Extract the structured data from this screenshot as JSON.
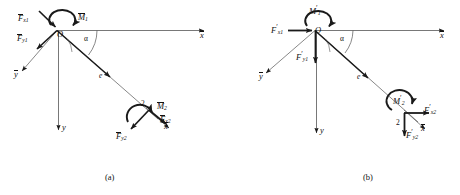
{
  "figure": {
    "type": "mechanics-free-body-diagram",
    "stroke_color": "#1a1a1a",
    "text_color": "#111111",
    "background": "#ffffff"
  },
  "panels": [
    {
      "id": "a",
      "caption": "(a)",
      "origin_label": "O",
      "angle_label": "α",
      "eccentricity_label": "e",
      "point_label": "2",
      "axes": [
        {
          "name": "x-bar-axis",
          "label": "x",
          "accent": "bar",
          "direction": "right"
        },
        {
          "name": "y-bar-axis",
          "label": "y",
          "accent": "bar",
          "direction": "down-left"
        },
        {
          "name": "y-axis",
          "label": "y",
          "accent": "none",
          "direction": "down"
        },
        {
          "name": "x-bar-axis-point2",
          "label": "x",
          "accent": "bar",
          "direction": "down-right"
        }
      ],
      "forces": [
        {
          "name": "force-x1",
          "symbol": "F",
          "accent": "bar",
          "sub": "x1",
          "at": "O",
          "direction": "down-right"
        },
        {
          "name": "force-y1",
          "symbol": "F",
          "accent": "bar",
          "sub": "y1",
          "at": "O",
          "direction": "down-left"
        },
        {
          "name": "force-x2",
          "symbol": "F",
          "accent": "bar",
          "sub": "x2",
          "at": "2",
          "direction": "down-right"
        },
        {
          "name": "force-y2",
          "symbol": "F",
          "accent": "bar",
          "sub": "y2",
          "at": "2",
          "direction": "down-left"
        }
      ],
      "moments": [
        {
          "name": "moment-1",
          "symbol": "M",
          "accent": "bar",
          "sub": "1",
          "at": "O",
          "sense": "clockwise"
        },
        {
          "name": "moment-2",
          "symbol": "M",
          "accent": "bar",
          "sub": "2",
          "at": "2",
          "sense": "clockwise"
        }
      ]
    },
    {
      "id": "b",
      "caption": "(b)",
      "origin_label": "O",
      "angle_label": "α",
      "eccentricity_label": "e",
      "point_label": "2",
      "axes": [
        {
          "name": "x-bar-axis",
          "label": "x",
          "accent": "bar",
          "direction": "right"
        },
        {
          "name": "y-bar-axis",
          "label": "y",
          "accent": "bar",
          "direction": "down-left"
        },
        {
          "name": "y-axis",
          "label": "y",
          "accent": "none",
          "direction": "down"
        },
        {
          "name": "x-bar-axis-point2",
          "label": "x",
          "accent": "bar",
          "direction": "down-right"
        }
      ],
      "forces": [
        {
          "name": "force-x1",
          "symbol": "F",
          "accent": "prime",
          "sub": "x1",
          "at": "O",
          "direction": "right"
        },
        {
          "name": "force-y1",
          "symbol": "F",
          "accent": "prime",
          "sub": "y1",
          "at": "O",
          "direction": "down"
        },
        {
          "name": "force-x2",
          "symbol": "F",
          "accent": "prime",
          "sub": "x2",
          "at": "2",
          "direction": "right"
        },
        {
          "name": "force-y2",
          "symbol": "F",
          "accent": "prime",
          "sub": "y2",
          "at": "2",
          "direction": "down"
        }
      ],
      "moments": [
        {
          "name": "moment-1",
          "symbol": "M",
          "accent": "prime",
          "sub": "1",
          "at": "O",
          "sense": "clockwise"
        },
        {
          "name": "moment-2",
          "symbol": "M",
          "accent": "prime",
          "sub": "2",
          "at": "2",
          "sense": "clockwise"
        }
      ]
    }
  ],
  "labels": {
    "a": {
      "O": "O",
      "alpha": "α",
      "e": "e",
      "two": "2",
      "x_bar": "x",
      "y_bar": "y",
      "y": "y",
      "x_bar_2": "x",
      "F": "F",
      "M": "M",
      "sub_x1": "x1",
      "sub_y1": "y1",
      "sub_x2": "x2",
      "sub_y2": "y2",
      "sub_1": "1",
      "sub_2": "2",
      "caption": "(a)"
    },
    "b": {
      "O": "O",
      "alpha": "α",
      "e": "e",
      "two": "2",
      "x_bar": "x",
      "y_bar": "y",
      "y": "y",
      "x_bar_2": "x",
      "F": "F",
      "M": "M",
      "prime": "′",
      "sub_x1": "x1",
      "sub_y1": "y1",
      "sub_x2": "x2",
      "sub_y2": "y2",
      "sub_1": "1",
      "sub_2": "2",
      "caption": "(b)"
    }
  }
}
